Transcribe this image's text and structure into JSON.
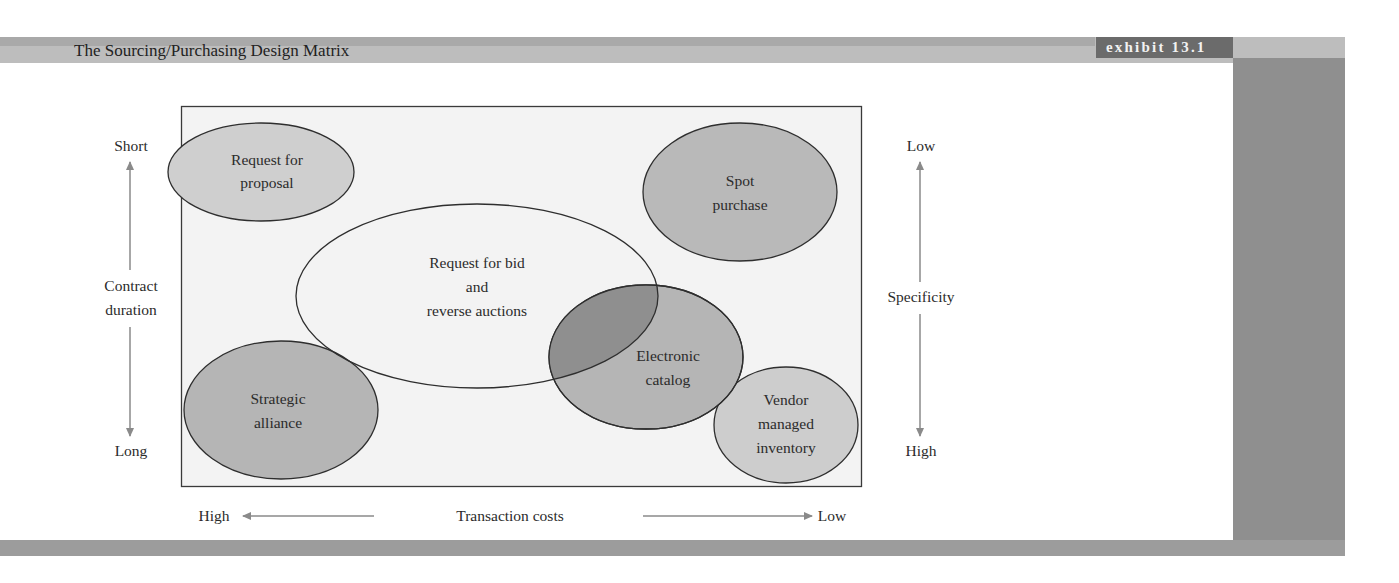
{
  "header": {
    "title": "The Sourcing/Purchasing Design Matrix",
    "exhibit_label": "exhibit 13.1"
  },
  "colors": {
    "header_band": "#bdbdbd",
    "exhibit_badge": "#6b6b6b",
    "side_column": "#8f8f8f",
    "matrix_background": "#f3f3f3",
    "ellipse_light": "#cfcfcf",
    "ellipse_medium": "#b5b5b5",
    "ellipse_overlap": "#8f8f8f",
    "arrow": "#8a8a8a"
  },
  "left_axis": {
    "top_label": "Short",
    "title_line1": "Contract",
    "title_line2": "duration",
    "bottom_label": "Long"
  },
  "right_axis": {
    "top_label": "Low",
    "title": "Specificity",
    "bottom_label": "High"
  },
  "bottom_axis": {
    "left_label": "High",
    "title": "Transaction costs",
    "right_label": "Low"
  },
  "ellipses": [
    {
      "id": "rfp",
      "line1": "Request for",
      "line2": "proposal"
    },
    {
      "id": "spot",
      "line1": "Spot",
      "line2": "purchase"
    },
    {
      "id": "rfb",
      "line1": "Request for bid",
      "line2": "and",
      "line3": "reverse auctions"
    },
    {
      "id": "ecatalog",
      "line1": "Electronic",
      "line2": "catalog"
    },
    {
      "id": "strategic",
      "line1": "Strategic",
      "line2": "alliance"
    },
    {
      "id": "vmi",
      "line1": "Vendor",
      "line2": "managed",
      "line3": "inventory"
    }
  ]
}
